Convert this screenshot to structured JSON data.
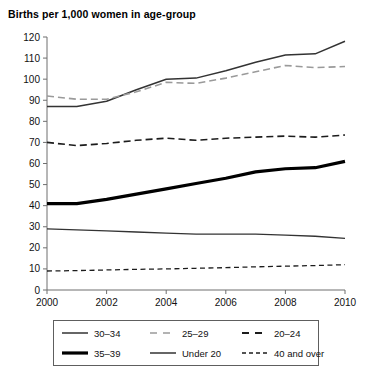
{
  "chart_data": {
    "type": "line",
    "title": "Births per 1,000 women in age-group",
    "xlabel": "",
    "ylabel": "",
    "xlim": [
      2000,
      2010
    ],
    "ylim": [
      0,
      120
    ],
    "grid": false,
    "legend_position": "bottom",
    "x": [
      2000,
      2001,
      2002,
      2003,
      2004,
      2005,
      2006,
      2007,
      2008,
      2009,
      2010
    ],
    "x_tick_labels": [
      "2000",
      "2002",
      "2004",
      "2006",
      "2008",
      "2010"
    ],
    "x_ticks": [
      2000,
      2002,
      2004,
      2006,
      2008,
      2010
    ],
    "y_ticks": [
      0,
      10,
      20,
      30,
      40,
      50,
      60,
      70,
      80,
      90,
      100,
      110,
      120
    ],
    "y_tick_labels": [
      "0",
      "10",
      "20",
      "30",
      "40",
      "50",
      "60",
      "70",
      "80",
      "90",
      "100",
      "110",
      "120"
    ],
    "series": [
      {
        "name": "30–34",
        "style": "solid-thin",
        "color": "#333333",
        "values": [
          87,
          87,
          89.5,
          95,
          100,
          100.5,
          104,
          108,
          111.5,
          112,
          118
        ]
      },
      {
        "name": "25–29",
        "style": "dashed-light",
        "color": "#9a9a9a",
        "values": [
          92,
          90.5,
          90.5,
          94,
          98.5,
          98,
          100.5,
          103.5,
          106.5,
          105.5,
          106
        ]
      },
      {
        "name": "20–24",
        "style": "dashed-dark",
        "color": "#1c1c1c",
        "values": [
          70,
          68.5,
          69.5,
          71,
          72,
          71,
          72,
          72.5,
          73,
          72.5,
          73.5
        ]
      },
      {
        "name": "35–39",
        "style": "solid-thick",
        "color": "#000000",
        "values": [
          41,
          41,
          43,
          45.5,
          48,
          50.5,
          53,
          56,
          57.5,
          58,
          61
        ]
      },
      {
        "name": "Under 20",
        "style": "solid-thin",
        "color": "#333333",
        "values": [
          29,
          28.5,
          28,
          27.5,
          27,
          26.5,
          26.5,
          26.5,
          26,
          25.5,
          24.5
        ]
      },
      {
        "name": "40 and over",
        "style": "dashed-fine",
        "color": "#1c1c1c",
        "values": [
          9,
          9.2,
          9.5,
          9.8,
          10,
          10.3,
          10.6,
          11,
          11.3,
          11.6,
          12
        ]
      }
    ]
  },
  "legend": {
    "items": [
      {
        "label": "30–34",
        "swatch": "solid-thin"
      },
      {
        "label": "25–29",
        "swatch": "dashed-light"
      },
      {
        "label": "20–24",
        "swatch": "dashed-dark"
      },
      {
        "label": "35–39",
        "swatch": "solid-thick"
      },
      {
        "label": "Under 20",
        "swatch": "solid-thin"
      },
      {
        "label": "40 and over",
        "swatch": "dashed-fine"
      }
    ]
  }
}
